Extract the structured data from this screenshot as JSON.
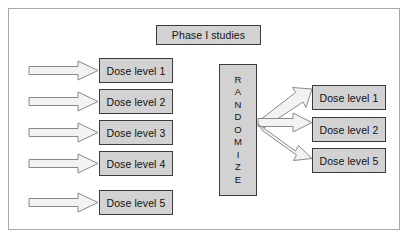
{
  "figure": {
    "title_box": {
      "label": "Phase I studies"
    },
    "randomize": {
      "label": "RANDOMIZE",
      "letters": [
        "R",
        "A",
        "N",
        "D",
        "O",
        "M",
        "I",
        "Z",
        "E"
      ]
    },
    "left_column": {
      "caption": "Dose escalation cohorts",
      "boxes": [
        {
          "label": "Dose level 1"
        },
        {
          "label": "Dose level 2"
        },
        {
          "label": "Dose level 3"
        },
        {
          "label": "Dose level 4"
        },
        {
          "label": "Dose level 5"
        }
      ]
    },
    "right_column": {
      "caption": "Randomized dose levels",
      "boxes": [
        {
          "label": "Dose level 1"
        },
        {
          "label": "Dose level 2"
        },
        {
          "label": "Dose level 5"
        }
      ]
    },
    "colors": {
      "box_fill": "#d2d2d2",
      "box_border": "#3a3a3a",
      "arrow_fill": "#f2f2f2",
      "arrow_border": "#8a8a8a",
      "frame_border": "#a8a8a8",
      "background": "#ffffff",
      "text": "#111111"
    },
    "arrows": {
      "left_inflow_count": 5,
      "randomize_outflow_count": 3
    }
  }
}
